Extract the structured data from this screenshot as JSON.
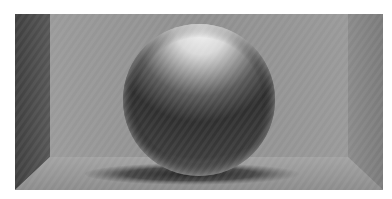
{
  "image": {
    "description": "3D rendered shaded sphere resting on the floor inside an open box with back wall, side walls and floor",
    "subject": "sphere",
    "colors": {
      "back_wall": "#8f8f8f",
      "left_wall": "#4a4a4a",
      "right_wall": "#7f7f7f",
      "floor": "#9a9a9a",
      "sphere_highlight": "#f2f2f2",
      "sphere_shadow": "#2a2a2a",
      "cast_shadow": "#303030",
      "background": "#ffffff"
    }
  }
}
